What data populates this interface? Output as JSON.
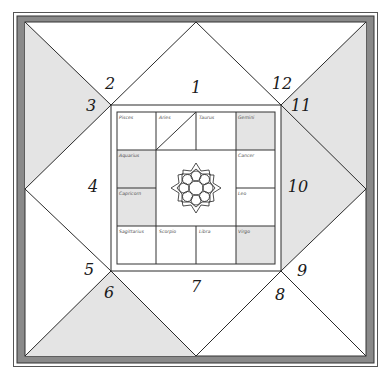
{
  "chart": {
    "title": "",
    "style": "South-Indian / North-Indian hybrid astrology chart",
    "colors": {
      "border_dark": "#8a8a8a",
      "shade": "#e4e4e4",
      "line": "#2a2a2a",
      "background": "#ffffff"
    },
    "houses": [
      {
        "number": "1",
        "shaded": false
      },
      {
        "number": "2",
        "shaded": false
      },
      {
        "number": "3",
        "shaded": true
      },
      {
        "number": "4",
        "shaded": false
      },
      {
        "number": "5",
        "shaded": false
      },
      {
        "number": "6",
        "shaded": true
      },
      {
        "number": "7",
        "shaded": false
      },
      {
        "number": "8",
        "shaded": false
      },
      {
        "number": "9",
        "shaded": false
      },
      {
        "number": "10",
        "shaded": true
      },
      {
        "number": "11",
        "shaded": true
      },
      {
        "number": "12",
        "shaded": false
      }
    ],
    "signs": {
      "pisces": "Pisces",
      "aries": "Aries",
      "taurus": "Taurus",
      "gemini": "Gemini",
      "aquarius": "Aquarius",
      "cancer": "Cancer",
      "capricorn": "Capricorn",
      "leo": "Leo",
      "sagittarius": "Sagittarius",
      "scorpio": "Scorpio",
      "libra": "Libra",
      "virgo": "Virgo"
    },
    "center_ornament": "lotus-mandala-icon"
  }
}
